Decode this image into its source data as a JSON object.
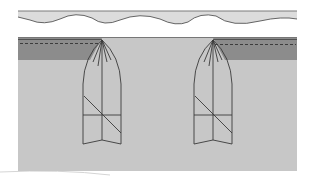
{
  "figure": {
    "colors": {
      "background": "#ffffff",
      "fabric": "#c7c7c7",
      "top_strip": "#dcdcdc",
      "facing_band": "#8c8c8c",
      "outline": "#3a3a3a",
      "shadow": "#bdbdbd"
    },
    "elements": [
      {
        "id": "top-strip",
        "label": "Waistband strip with wavy edge"
      },
      {
        "id": "fabric-panel",
        "label": "Garment fabric panel"
      },
      {
        "id": "left-facing",
        "label": "Left folded facing with stitch line"
      },
      {
        "id": "right-facing",
        "label": "Right folded facing with stitch line"
      },
      {
        "id": "left-pleat",
        "label": "Left pleat outline"
      },
      {
        "id": "right-pleat",
        "label": "Right pleat outline"
      }
    ]
  }
}
